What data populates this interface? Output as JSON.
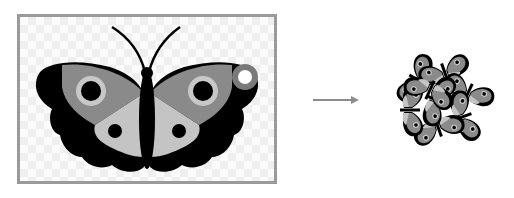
{
  "diagram": {
    "source": {
      "label": "",
      "subject": "butterfly",
      "background": "transparent-checkerboard",
      "frame_color": "#9a9a9a",
      "colors": {
        "outline": "#000000",
        "upper_wing": "#8a8a8a",
        "lower_wing": "#c4c4c4",
        "eye_ring": "#c8c8c8",
        "rotation_handle": "#7a7a7a"
      }
    },
    "arrow": {
      "direction": "right",
      "color": "#8c8c8c"
    },
    "result": {
      "subject": "cluster of rotated butterfly copies",
      "copies": 8,
      "rotations_deg": [
        -60,
        -20,
        25,
        70,
        115,
        160,
        205,
        250
      ]
    }
  }
}
